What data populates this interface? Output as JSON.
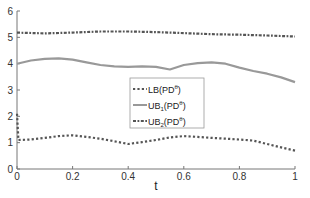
{
  "chart_data": {
    "type": "line",
    "title": "",
    "xlabel": "t",
    "ylabel": "",
    "xlim": [
      0,
      1
    ],
    "ylim": [
      0,
      6
    ],
    "grid": false,
    "legend_position": "center",
    "xticks": [
      "0",
      "0.2",
      "0.4",
      "0.6",
      "0.8",
      "1"
    ],
    "yticks": [
      "0",
      "1",
      "2",
      "3",
      "4",
      "5",
      "6"
    ],
    "series": [
      {
        "name": "LB(PD^θ)",
        "legend_label": "LB(PD",
        "legend_sup": "θ",
        "legend_sub": "",
        "style": "dotted",
        "color": "#555555",
        "x": [
          0,
          0.005,
          0.05,
          0.1,
          0.15,
          0.2,
          0.25,
          0.3,
          0.35,
          0.4,
          0.45,
          0.5,
          0.55,
          0.6,
          0.65,
          0.7,
          0.75,
          0.8,
          0.85,
          0.9,
          0.95,
          1.0
        ],
        "y": [
          2.1,
          1.1,
          1.12,
          1.18,
          1.25,
          1.28,
          1.22,
          1.15,
          1.05,
          0.95,
          1.02,
          1.1,
          1.2,
          1.25,
          1.22,
          1.18,
          1.15,
          1.12,
          1.08,
          0.95,
          0.82,
          0.7
        ]
      },
      {
        "name": "UB1(PD^θ)",
        "legend_label": "UB",
        "legend_sub": "1",
        "legend_mid": "(PD",
        "legend_sup": "θ",
        "style": "solid",
        "color": "#999999",
        "x": [
          0,
          0.05,
          0.1,
          0.15,
          0.2,
          0.25,
          0.3,
          0.35,
          0.4,
          0.45,
          0.5,
          0.55,
          0.6,
          0.65,
          0.7,
          0.75,
          0.8,
          0.85,
          0.9,
          0.95,
          1.0
        ],
        "y": [
          4.0,
          4.12,
          4.18,
          4.2,
          4.15,
          4.05,
          3.95,
          3.9,
          3.88,
          3.9,
          3.88,
          3.78,
          3.95,
          4.02,
          4.05,
          4.0,
          3.85,
          3.72,
          3.62,
          3.48,
          3.3
        ]
      },
      {
        "name": "UB2(PD^θ)",
        "legend_label": "UB",
        "legend_sub": "2",
        "legend_mid": "(PD",
        "legend_sup": "θ",
        "style": "dashdot",
        "color": "#555555",
        "x": [
          0,
          0.1,
          0.2,
          0.3,
          0.4,
          0.5,
          0.6,
          0.7,
          0.8,
          0.9,
          1.0
        ],
        "y": [
          5.18,
          5.15,
          5.18,
          5.22,
          5.22,
          5.2,
          5.16,
          5.12,
          5.1,
          5.07,
          5.03
        ]
      }
    ]
  }
}
